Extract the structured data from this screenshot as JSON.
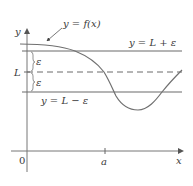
{
  "diagram": {
    "labels": {
      "y_axis": "y",
      "x_axis": "x",
      "origin": "0",
      "a_tick": "a",
      "L": "L",
      "epsilon_upper": "ε",
      "epsilon_lower": "ε",
      "curve": "y = f(x)",
      "upper_line": "y = L + ε",
      "lower_line": "y = L − ε"
    },
    "colors": {
      "stroke": "#6a6a6a",
      "curve": "#707070",
      "text": "#3a3a3a",
      "background": "#ffffff"
    },
    "geometry": {
      "y_axis_x": 27,
      "x_axis_y": 151,
      "upper_line_y": 51,
      "L_line_y": 72,
      "lower_line_y": 92,
      "a_tick_x": 105
    }
  }
}
